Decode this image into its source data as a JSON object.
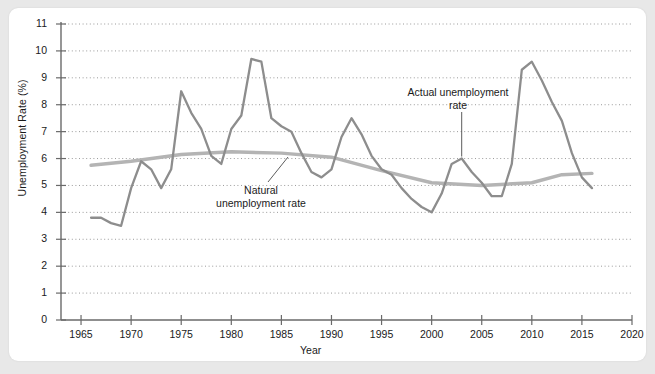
{
  "chart_data": {
    "type": "line",
    "title": "",
    "xlabel": "Year",
    "ylabel": "Unemployment Rate (%)",
    "xlim": [
      1963,
      2020
    ],
    "ylim": [
      0,
      11.4
    ],
    "xticks": [
      1965,
      1970,
      1975,
      1980,
      1985,
      1990,
      1995,
      2000,
      2005,
      2010,
      2015,
      2020
    ],
    "yticks": [
      0,
      1,
      2,
      3,
      4,
      5,
      6,
      7,
      8,
      9,
      10,
      11
    ],
    "grid": "horizontal-dotted",
    "legend_position": "inline-annotations",
    "series": [
      {
        "name": "Actual unemployment rate",
        "color": "#8d8d8d",
        "x": [
          1966,
          1967,
          1968,
          1969,
          1970,
          1971,
          1972,
          1973,
          1974,
          1975,
          1976,
          1977,
          1978,
          1979,
          1980,
          1981,
          1982,
          1983,
          1984,
          1985,
          1986,
          1987,
          1988,
          1989,
          1990,
          1991,
          1992,
          1993,
          1994,
          1995,
          1996,
          1997,
          1998,
          1999,
          2000,
          2001,
          2002,
          2003,
          2004,
          2005,
          2006,
          2007,
          2008,
          2009,
          2010,
          2011,
          2012,
          2013,
          2014,
          2015,
          2016
        ],
        "values": [
          3.8,
          3.8,
          3.6,
          3.5,
          4.9,
          5.9,
          5.6,
          4.9,
          5.6,
          8.5,
          7.7,
          7.1,
          6.1,
          5.8,
          7.1,
          7.6,
          9.7,
          9.6,
          7.5,
          7.2,
          7.0,
          6.2,
          5.5,
          5.3,
          5.6,
          6.8,
          7.5,
          6.9,
          6.1,
          5.6,
          5.4,
          4.9,
          4.5,
          4.2,
          4.0,
          4.7,
          5.8,
          6.0,
          5.5,
          5.1,
          4.6,
          4.6,
          5.8,
          9.3,
          9.6,
          8.9,
          8.1,
          7.4,
          6.2,
          5.3,
          4.9
        ]
      },
      {
        "name": "Natural unemployment rate",
        "color": "#b4b4b4",
        "x": [
          1966,
          1970,
          1975,
          1980,
          1985,
          1990,
          1995,
          2000,
          2005,
          2010,
          2013,
          2016
        ],
        "values": [
          5.75,
          5.9,
          6.15,
          6.25,
          6.2,
          6.05,
          5.55,
          5.1,
          5.0,
          5.1,
          5.4,
          5.45
        ]
      }
    ],
    "annotations": [
      {
        "id": "actual",
        "line1": "Actual unemployment",
        "line2": "rate",
        "points_to_year": 2003
      },
      {
        "id": "natural",
        "line1": "Natural",
        "line2": "unemployment rate",
        "points_to_year": 1987
      }
    ]
  },
  "axis": {
    "y_tick_labels": [
      "0",
      "1",
      "2",
      "3",
      "4",
      "5",
      "6",
      "7",
      "8",
      "9",
      "10",
      "11"
    ],
    "x_tick_labels": [
      "1965",
      "1970",
      "1975",
      "1980",
      "1985",
      "1990",
      "1995",
      "2000",
      "2005",
      "2010",
      "2015",
      "2020"
    ],
    "x_title": "Year",
    "y_title": "Unemployment Rate (%)"
  },
  "annotation_text": {
    "actual_line1": "Actual unemployment",
    "actual_line2": "rate",
    "natural_line1": "Natural",
    "natural_line2": "unemployment rate"
  },
  "colors": {
    "actual_line": "#8d8d8d",
    "natural_line": "#b4b4b4",
    "axis": "#6a6a6a",
    "grid": "#9a9a9a",
    "card": "#ffffff",
    "page_background": "#e8e8e8"
  }
}
